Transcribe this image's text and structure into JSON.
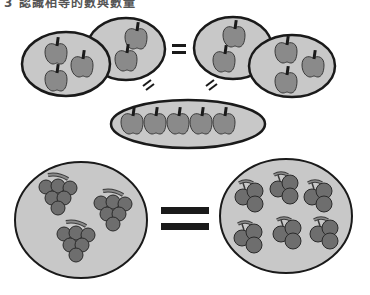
{
  "title": "3 認識相等的數與數量",
  "colors": {
    "background": "#ffffff",
    "group_fill": "#c8c8c8",
    "outline": "#1a1a1a",
    "fruit_fill": "#8a8a8a",
    "fruit_stroke": "#3a3a3a",
    "grape_fill": "#6e6e6e"
  },
  "top_section": {
    "description": "Apple groups equality",
    "left_pair": {
      "group_a_apples": 3,
      "group_b_apples": 2
    },
    "equals_symbol": "=",
    "right_pair": {
      "group_a_apples": 2,
      "group_b_apples": 3
    },
    "combined_group_apples": 5,
    "relation_marks": [
      "//",
      "//"
    ]
  },
  "bottom_section": {
    "description": "Grape bunches vs grape clusters",
    "left_group": {
      "bunches": 3,
      "label": "3 bunches of grapes"
    },
    "equals_symbol": "=",
    "right_group": {
      "clusters": 6,
      "label": "6 small grape clusters"
    }
  }
}
